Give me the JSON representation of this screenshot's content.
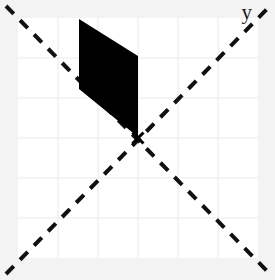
{
  "figure": {
    "title": "",
    "axis_label_y": "y",
    "background_color": "#f3f3f3",
    "plot_background_color": "#ffffff",
    "grid_color": "#eaeaea",
    "line_color": "#111111",
    "shape_fill_color": "#000000"
  },
  "chart_data": {
    "type": "scatter",
    "title": "",
    "xlabel": "",
    "ylabel": "y",
    "xlim": [
      -3,
      3
    ],
    "ylim": [
      -3,
      3
    ],
    "grid": true,
    "legend": null,
    "plot_rect_px": {
      "x": 18,
      "y": 18,
      "width": 240,
      "height": 240
    },
    "grid_spacing_px": 40,
    "grid_x_px": [
      58,
      98,
      138,
      178,
      218
    ],
    "grid_y_px": [
      58,
      98,
      138,
      178,
      218
    ],
    "annotations": [
      {
        "name": "center-cross",
        "type": "marker",
        "marker": "x",
        "x_px": 138,
        "y_px": 138,
        "color": "#000000",
        "size_px": 11
      }
    ],
    "series": [
      {
        "name": "diagonal-line-descending",
        "type": "line",
        "style": "dashed",
        "color": "#111111",
        "width_px": 4,
        "dash_px": [
          11,
          9
        ],
        "points_px": [
          [
            6,
            6
          ],
          [
            270,
            274
          ]
        ]
      },
      {
        "name": "diagonal-line-ascending",
        "type": "line",
        "style": "dashed",
        "color": "#111111",
        "width_px": 4,
        "dash_px": [
          11,
          9
        ],
        "points_px": [
          [
            6,
            274
          ],
          [
            270,
            6
          ]
        ]
      },
      {
        "name": "filled-parallelogram",
        "type": "polygon",
        "fill": "#000000",
        "stroke": "none",
        "vertices_px": [
          [
            79,
            19
          ],
          [
            138,
            56
          ],
          [
            138,
            137
          ],
          [
            79,
            89
          ]
        ]
      }
    ]
  }
}
